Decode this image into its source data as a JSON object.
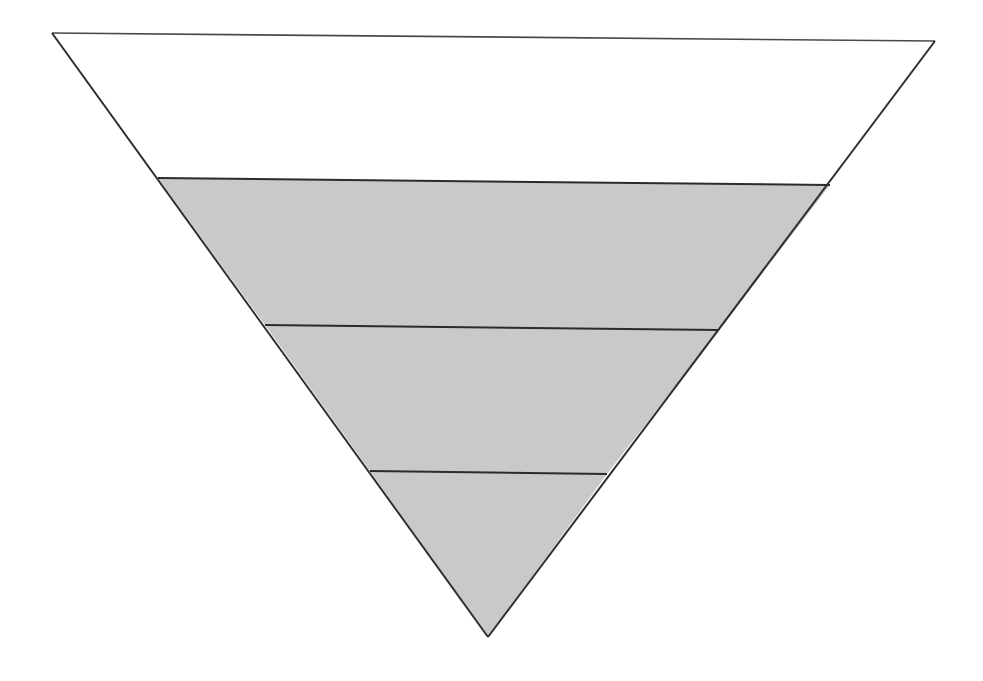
{
  "figure": {
    "name": "inverted-triangle-funnel-diagram",
    "type": "inverted-triangle",
    "background_color": "#ffffff",
    "outline_color": "#2e2e2e",
    "fill_color": "#c9c9c9",
    "empty_fill_color": "#ffffff",
    "canvas": {
      "width": 983,
      "height": 681
    },
    "labels": [],
    "annotations": [],
    "geometry": {
      "top_left": {
        "x": 52,
        "y": 33
      },
      "top_right": {
        "x": 935,
        "y": 41
      },
      "apex": {
        "x": 488,
        "y": 637
      },
      "divider_y_left": [
        178,
        325,
        471
      ],
      "divider_y_right": [
        185,
        330,
        474
      ]
    }
  },
  "chart_data": {
    "type": "funnel",
    "title": "",
    "subtitle": "",
    "xlabel": "",
    "ylabel": "",
    "orientation": "inverted-triangle",
    "grid": false,
    "legend": null,
    "categories": [
      "Band 1",
      "Band 2",
      "Band 3",
      "Band 4"
    ],
    "series": [
      {
        "name": "Band width (relative)",
        "values": [
          100,
          76,
          51,
          27
        ]
      }
    ],
    "bands": [
      {
        "index": 1,
        "position": "top",
        "filled": false,
        "fill": "#ffffff",
        "top_width_px": 883,
        "bottom_width_px": 672,
        "top_y": 33,
        "bottom_y": 181,
        "label": ""
      },
      {
        "index": 2,
        "position": "upper-middle",
        "filled": true,
        "fill": "#c9c9c9",
        "top_width_px": 672,
        "bottom_width_px": 454,
        "top_y": 181,
        "bottom_y": 327,
        "label": ""
      },
      {
        "index": 3,
        "position": "lower-middle",
        "filled": true,
        "fill": "#c9c9c9",
        "top_width_px": 454,
        "bottom_width_px": 237,
        "top_y": 327,
        "bottom_y": 472,
        "label": ""
      },
      {
        "index": 4,
        "position": "bottom-apex",
        "filled": true,
        "fill": "#c9c9c9",
        "top_width_px": 237,
        "bottom_width_px": 0,
        "top_y": 472,
        "bottom_y": 637,
        "label": ""
      }
    ],
    "dividers": [
      {
        "index": 1,
        "left": {
          "x": 158,
          "y": 178
        },
        "right": {
          "x": 830,
          "y": 185
        }
      },
      {
        "index": 2,
        "left": {
          "x": 265,
          "y": 325
        },
        "right": {
          "x": 719,
          "y": 330
        }
      },
      {
        "index": 3,
        "left": {
          "x": 370,
          "y": 471
        },
        "right": {
          "x": 607,
          "y": 474
        }
      }
    ]
  }
}
